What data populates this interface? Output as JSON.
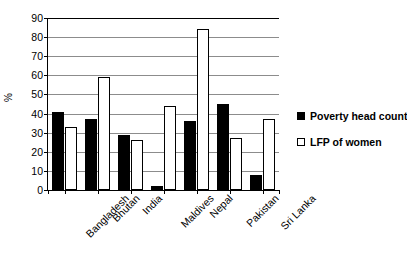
{
  "chart_data": {
    "type": "bar",
    "title": "",
    "xlabel": "",
    "ylabel": "%",
    "ylim": [
      0,
      90
    ],
    "yticks": [
      0,
      10,
      20,
      30,
      40,
      50,
      60,
      70,
      80,
      90
    ],
    "grid": true,
    "legend_position": "right",
    "categories": [
      "Bangladesh",
      "Bhutan",
      "India",
      "Maldives",
      "Nepal",
      "Pakistan",
      "Sri Lanka"
    ],
    "series": [
      {
        "name": "Poverty head count",
        "color": "#000000",
        "style": "filled",
        "values": [
          41,
          37,
          29,
          2,
          36,
          45,
          8
        ]
      },
      {
        "name": "LFP of women",
        "color": "#ffffff",
        "style": "open",
        "values": [
          33,
          59,
          26,
          44,
          84,
          27,
          37
        ]
      }
    ]
  }
}
